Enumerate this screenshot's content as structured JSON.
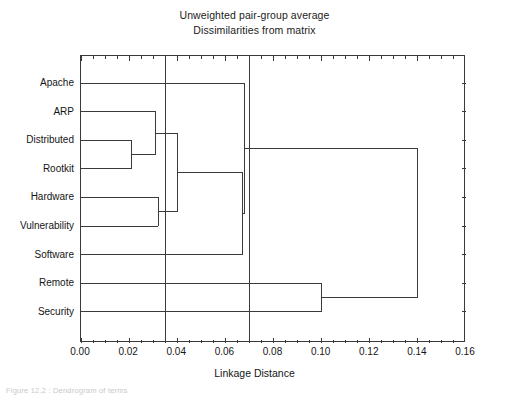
{
  "title": {
    "line1": "Unweighted pair-group average",
    "line2": "Dissimilarities from matrix"
  },
  "axis": {
    "x_title": "Linkage Distance",
    "x_ticks": [
      "0.00",
      "0.02",
      "0.04",
      "0.06",
      "0.08",
      "0.10",
      "0.12",
      "0.14",
      "0.16"
    ],
    "x_min": 0.0,
    "x_max": 0.16
  },
  "caption": "Figure 12.2 : Dendrogram of terms",
  "colors": {
    "line": "#3a3a3a",
    "axis": "#3a3a3a",
    "background": "#ffffff",
    "text": "#151515"
  },
  "chart_data": {
    "type": "line",
    "subtype": "dendrogram",
    "title": "Unweighted pair-group average",
    "subtitle": "Dissimilarities from matrix",
    "xlabel": "Linkage Distance",
    "ylabel": "",
    "xlim": [
      0.0,
      0.16
    ],
    "xticks": [
      0.0,
      0.02,
      0.04,
      0.06,
      0.08,
      0.1,
      0.12,
      0.14,
      0.16
    ],
    "grid": false,
    "legend": null,
    "orientation": "horizontal",
    "leaves": [
      "Apache",
      "ARP",
      "Distributed",
      "Rootkit",
      "Hardware",
      "Vulnerability",
      "Software",
      "Remote",
      "Security"
    ],
    "merges": [
      {
        "id": "m1",
        "left": "Distributed",
        "right": "Rootkit",
        "distance": 0.021
      },
      {
        "id": "m2",
        "left": "ARP",
        "right": "m1",
        "distance": 0.031
      },
      {
        "id": "m3",
        "left": "Hardware",
        "right": "Vulnerability",
        "distance": 0.032
      },
      {
        "id": "m4",
        "left": "m2",
        "right": "m3",
        "distance": 0.04
      },
      {
        "id": "m5",
        "left": "m4",
        "right": "Software",
        "distance": 0.067
      },
      {
        "id": "m6",
        "left": "Apache",
        "right": "m5",
        "distance": 0.068
      },
      {
        "id": "m7",
        "left": "Remote",
        "right": "Security",
        "distance": 0.1
      },
      {
        "id": "m8",
        "left": "m6",
        "right": "m7",
        "distance": 0.14
      }
    ],
    "reference_lines": [
      0.035,
      0.07
    ],
    "annotations": []
  }
}
